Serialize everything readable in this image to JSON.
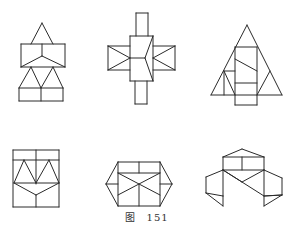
{
  "caption": {
    "label": "图",
    "number": "151"
  },
  "colors": {
    "stroke": "#2a2a2a",
    "background": "#ffffff",
    "caption": "#333333"
  },
  "figures": [
    {
      "name": "figure-1-tower",
      "lines": [
        [
          42,
          23,
          31,
          44
        ],
        [
          42,
          23,
          53,
          44
        ],
        [
          21,
          44,
          65,
          44
        ],
        [
          21,
          44,
          21,
          67
        ],
        [
          65,
          44,
          65,
          67
        ],
        [
          21,
          67,
          65,
          67
        ],
        [
          42,
          44,
          42,
          56
        ],
        [
          42,
          56,
          21,
          67
        ],
        [
          42,
          56,
          65,
          67
        ],
        [
          31,
          67,
          19,
          88
        ],
        [
          31,
          67,
          41,
          88
        ],
        [
          53,
          67,
          41,
          88
        ],
        [
          53,
          67,
          63,
          88
        ],
        [
          19,
          88,
          63,
          88
        ],
        [
          19,
          88,
          19,
          101
        ],
        [
          63,
          88,
          63,
          101
        ],
        [
          19,
          101,
          63,
          101
        ],
        [
          41,
          88,
          41,
          101
        ]
      ]
    },
    {
      "name": "figure-2-cross",
      "lines": [
        [
          136,
          13,
          148,
          13
        ],
        [
          136,
          13,
          136,
          36
        ],
        [
          148,
          13,
          148,
          36
        ],
        [
          130,
          36,
          153,
          36
        ],
        [
          130,
          36,
          130,
          81
        ],
        [
          153,
          36,
          153,
          81
        ],
        [
          130,
          81,
          153,
          81
        ],
        [
          153,
          36,
          145,
          58
        ],
        [
          145,
          58,
          153,
          81
        ],
        [
          130,
          58,
          145,
          58
        ],
        [
          108,
          46,
          130,
          46
        ],
        [
          108,
          46,
          108,
          70
        ],
        [
          108,
          70,
          130,
          70
        ],
        [
          108,
          46,
          130,
          58
        ],
        [
          108,
          70,
          130,
          58
        ],
        [
          153,
          46,
          175,
          46
        ],
        [
          175,
          46,
          175,
          70
        ],
        [
          153,
          70,
          175,
          70
        ],
        [
          175,
          46,
          153,
          58
        ],
        [
          175,
          70,
          153,
          58
        ],
        [
          135,
          81,
          135,
          104
        ],
        [
          147,
          81,
          147,
          104
        ],
        [
          135,
          104,
          147,
          104
        ]
      ]
    },
    {
      "name": "figure-3-triangle",
      "lines": [
        [
          247,
          25,
          211,
          95
        ],
        [
          247,
          25,
          282,
          95
        ],
        [
          211,
          95,
          282,
          95
        ],
        [
          235,
          47,
          257,
          47
        ],
        [
          235,
          47,
          235,
          105
        ],
        [
          257,
          47,
          257,
          105
        ],
        [
          235,
          105,
          257,
          105
        ],
        [
          235,
          59,
          257,
          71
        ],
        [
          235,
          83,
          257,
          83
        ],
        [
          224,
          71,
          235,
          71
        ],
        [
          224,
          71,
          224,
          95
        ],
        [
          224,
          71,
          235,
          95
        ],
        [
          257,
          95,
          270,
          71
        ]
      ]
    },
    {
      "name": "figure-4-rectangle",
      "lines": [
        [
          13,
          150,
          59,
          150
        ],
        [
          13,
          150,
          13,
          207
        ],
        [
          59,
          150,
          59,
          207
        ],
        [
          13,
          207,
          59,
          207
        ],
        [
          36,
          150,
          36,
          184
        ],
        [
          13,
          160,
          59,
          160
        ],
        [
          14,
          183,
          24,
          160
        ],
        [
          24,
          160,
          36,
          183
        ],
        [
          36,
          183,
          49,
          160
        ],
        [
          49,
          160,
          59,
          183
        ],
        [
          14,
          183,
          59,
          183
        ],
        [
          14,
          183,
          36,
          195
        ],
        [
          36,
          195,
          59,
          183
        ],
        [
          36,
          195,
          36,
          207
        ]
      ]
    },
    {
      "name": "figure-5-hexagon",
      "lines": [
        [
          118,
          162,
          160,
          162
        ],
        [
          118,
          162,
          106,
          184
        ],
        [
          106,
          184,
          118,
          206
        ],
        [
          160,
          162,
          172,
          184
        ],
        [
          172,
          184,
          160,
          206
        ],
        [
          118,
          206,
          160,
          206
        ],
        [
          118,
          162,
          118,
          206
        ],
        [
          160,
          162,
          160,
          206
        ],
        [
          139,
          162,
          139,
          173
        ],
        [
          118,
          173,
          160,
          173
        ],
        [
          118,
          173,
          160,
          195
        ],
        [
          160,
          173,
          118,
          195
        ],
        [
          139,
          184,
          139,
          206
        ],
        [
          106,
          184,
          118,
          184
        ],
        [
          160,
          184,
          172,
          184
        ]
      ]
    },
    {
      "name": "figure-6-cluster",
      "lines": [
        [
          242,
          149,
          223,
          157
        ],
        [
          242,
          149,
          264,
          157
        ],
        [
          223,
          157,
          264,
          157
        ],
        [
          223,
          157,
          223,
          170
        ],
        [
          264,
          157,
          264,
          170
        ],
        [
          242,
          157,
          242,
          170
        ],
        [
          223,
          170,
          264,
          170
        ],
        [
          223,
          170,
          242,
          182
        ],
        [
          264,
          170,
          242,
          182
        ],
        [
          223,
          170,
          206,
          177
        ],
        [
          206,
          177,
          206,
          193
        ],
        [
          206,
          193,
          223,
          196
        ],
        [
          223,
          170,
          223,
          196
        ],
        [
          206,
          193,
          223,
          206
        ],
        [
          223,
          196,
          223,
          206
        ],
        [
          223,
          170,
          264,
          196
        ],
        [
          264,
          170,
          282,
          178
        ],
        [
          282,
          178,
          282,
          195
        ],
        [
          282,
          195,
          264,
          196
        ],
        [
          264,
          170,
          264,
          206
        ],
        [
          264,
          196,
          282,
          195
        ],
        [
          264,
          206,
          282,
          195
        ]
      ]
    }
  ]
}
